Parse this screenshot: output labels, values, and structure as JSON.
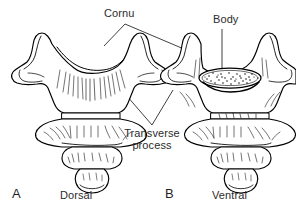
{
  "figure": {
    "type": "anatomical-line-drawing",
    "background_color": "#ffffff",
    "ink_color": "#000000",
    "text_color": "#2b2b2b",
    "labels": {
      "cornu": "Cornu",
      "body": "Body",
      "transverse_process_line1": "Transverse",
      "transverse_process_line2": "process"
    },
    "panels": [
      {
        "letter": "A",
        "caption": "Dorsal",
        "id": "panel-a"
      },
      {
        "letter": "B",
        "caption": "Ventral",
        "id": "panel-b"
      }
    ],
    "leaders": {
      "cornu": "apex at (125,24) branching to left wing tip (104,46) and right wing tip (191,52)",
      "body": "vertical line from (222,29) to (222,72)",
      "transverse_process": "apex at (152,125) branching up-left to (120,88) and up-right to (173,90)"
    }
  }
}
